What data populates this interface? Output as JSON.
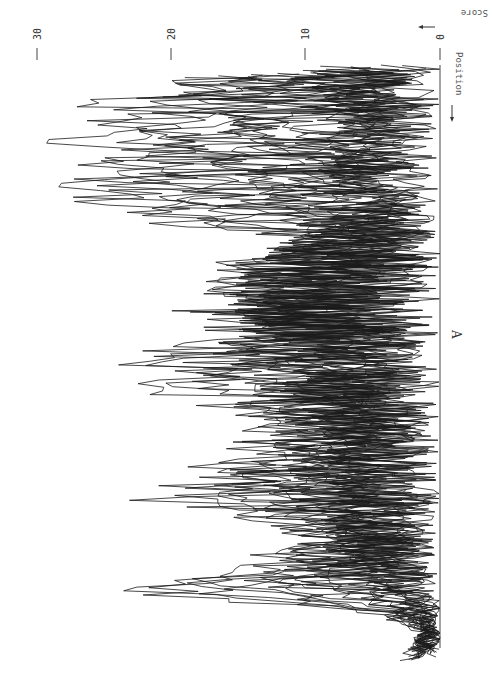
{
  "figure": {
    "panel_label": "A",
    "score_axis_label": "Score",
    "position_axis_label": "Position",
    "line_color": "#1a1a1a",
    "background": "#ffffff"
  },
  "chart_data": {
    "type": "line",
    "title": "",
    "orientation": "rotated-90 (score increases leftward, position increases downward)",
    "xlabel": "Position",
    "ylabel": "Score",
    "ylim": [
      0,
      33
    ],
    "yticks": [
      0,
      10,
      20,
      30
    ],
    "grid": false,
    "legend": null,
    "annotations": [
      "A"
    ],
    "x": [
      0,
      4,
      8,
      12,
      16,
      20,
      24,
      28,
      32,
      36,
      40,
      44,
      48,
      52,
      56,
      60,
      64,
      68,
      72,
      76,
      80,
      84,
      88,
      92,
      96,
      100
    ],
    "series": [
      {
        "name": "upper envelope",
        "values": [
          25,
          30,
          31,
          31,
          32,
          33,
          26,
          12,
          19,
          21,
          22,
          20,
          27,
          27,
          20,
          15,
          18,
          22,
          25,
          17,
          12,
          18,
          28,
          6,
          1,
          4
        ]
      },
      {
        "name": "dense band upper bound",
        "values": [
          9,
          9,
          8,
          8,
          8,
          8,
          7,
          10,
          13,
          15,
          16,
          14,
          12,
          10,
          11,
          10,
          9,
          9,
          8,
          8,
          8,
          7,
          6,
          3,
          2,
          2
        ]
      }
    ]
  }
}
